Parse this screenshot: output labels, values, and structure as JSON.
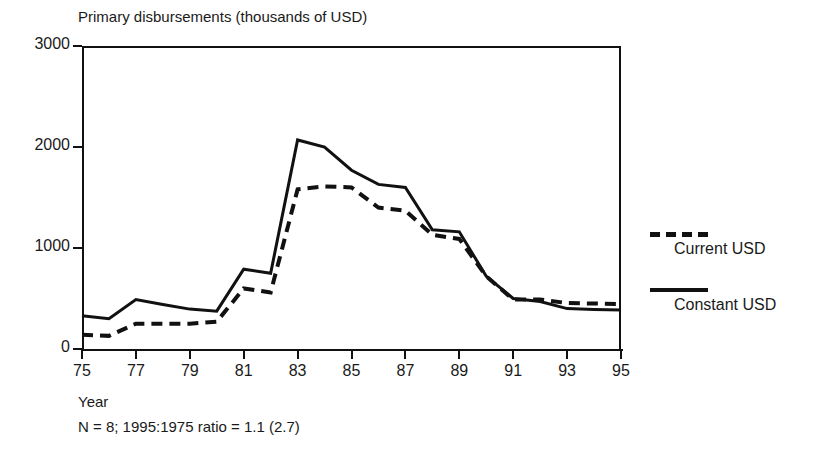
{
  "chart_data": {
    "type": "line",
    "title": "Primary disbursements (thousands of USD)",
    "xlabel": "Year",
    "ylabel": "",
    "footnote": "N = 8; 1995:1975 ratio = 1.1 (2.7)",
    "grid": false,
    "legend_position": "right",
    "xlim": [
      1975,
      1995
    ],
    "ylim": [
      0,
      3000
    ],
    "yticks": [
      0,
      1000,
      2000,
      3000
    ],
    "ytick_labels": [
      "0",
      "1000",
      "2000",
      "3000"
    ],
    "xticks": [
      1975,
      1977,
      1979,
      1981,
      1983,
      1985,
      1987,
      1989,
      1991,
      1993,
      1995
    ],
    "xtick_labels": [
      "75",
      "77",
      "79",
      "81",
      "83",
      "85",
      "87",
      "89",
      "91",
      "93",
      "95"
    ],
    "x": [
      1975,
      1976,
      1977,
      1978,
      1979,
      1980,
      1981,
      1982,
      1983,
      1984,
      1985,
      1986,
      1987,
      1988,
      1989,
      1990,
      1991,
      1992,
      1993,
      1994,
      1995
    ],
    "series": [
      {
        "name": "Constant USD",
        "style": "solid",
        "color": "#111111",
        "values": [
          330,
          300,
          490,
          440,
          395,
          375,
          790,
          750,
          2070,
          2000,
          1770,
          1630,
          1600,
          1180,
          1160,
          720,
          500,
          470,
          400,
          390,
          385
        ]
      },
      {
        "name": "Current USD",
        "style": "dashed",
        "color": "#111111",
        "values": [
          140,
          130,
          250,
          250,
          250,
          270,
          600,
          560,
          1580,
          1610,
          1600,
          1400,
          1370,
          1130,
          1090,
          720,
          490,
          490,
          455,
          450,
          445
        ]
      }
    ]
  },
  "legend": {
    "items": [
      {
        "label": "Current USD",
        "style": "dashed"
      },
      {
        "label": "Constant USD",
        "style": "solid"
      }
    ]
  }
}
